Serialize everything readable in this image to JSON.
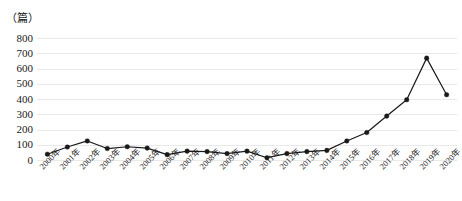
{
  "chart_data": {
    "type": "line",
    "title": "",
    "subtitle": "",
    "unit_label": "（篇）",
    "xlabel": "",
    "ylabel": "",
    "ylim": [
      0,
      800
    ],
    "ytick_step": 100,
    "yticks": [
      "800",
      "700",
      "600",
      "500",
      "400",
      "300",
      "200",
      "100",
      "0"
    ],
    "grid": true,
    "grid_orientation": "horizontal",
    "legend": false,
    "legend_position": "none",
    "marker": "filled-circle",
    "line_color": "#1a1a1a",
    "grid_color": "#e9e9e9",
    "categories": [
      "2000年",
      "2001年",
      "2002年",
      "2003年",
      "2004年",
      "2005年",
      "2006年",
      "2007年",
      "2008年",
      "2009年",
      "2010年",
      "2011年",
      "2012年",
      "2013年",
      "2014年",
      "2015年",
      "2016年",
      "2017年",
      "2018年",
      "2019年",
      "2020年"
    ],
    "values": [
      38,
      85,
      125,
      75,
      87,
      78,
      35,
      58,
      55,
      42,
      58,
      15,
      42,
      55,
      63,
      125,
      180,
      288,
      395,
      668,
      428
    ]
  }
}
